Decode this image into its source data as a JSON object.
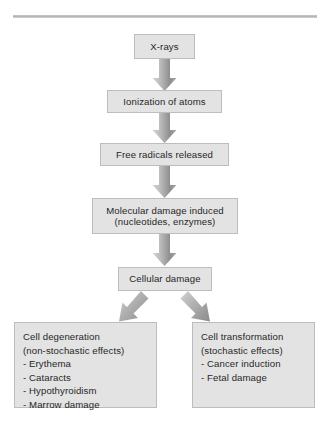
{
  "figure": {
    "background": "#ffffff",
    "rule_color": "#bdbdbd",
    "box_fill": "#e3e3e3",
    "box_border": "#bdbdbd",
    "arrow_color": "#9a9a9a",
    "text_color": "#272727"
  },
  "nodes": {
    "xrays": {
      "lines": [
        "X-rays"
      ]
    },
    "ionization": {
      "lines": [
        "Ionization of atoms"
      ]
    },
    "free_radicals": {
      "lines": [
        "Free radicals released"
      ]
    },
    "molecular_damage": {
      "lines": [
        "Molecular damage induced",
        "(nucleotides, enzymes)"
      ]
    },
    "cellular_damage": {
      "lines": [
        "Cellular damage"
      ]
    },
    "cell_degeneration": {
      "lines": [
        "Cell degeneration",
        "(non-stochastic effects)",
        "- Erythema",
        "- Cataracts",
        "- Hypothyroidism",
        "- Marrow damage"
      ]
    },
    "cell_transformation": {
      "lines": [
        "Cell transformation",
        "(stochastic effects)",
        "- Cancer induction",
        "- Fetal damage"
      ]
    }
  },
  "arrows": [
    {
      "name": "arrow-xrays-to-ionization",
      "direction": "down"
    },
    {
      "name": "arrow-ionization-to-free-radicals",
      "direction": "down"
    },
    {
      "name": "arrow-free-radicals-to-molecular-damage",
      "direction": "down"
    },
    {
      "name": "arrow-molecular-damage-to-cellular-damage",
      "direction": "down"
    },
    {
      "name": "arrow-cellular-damage-to-cell-degeneration",
      "direction": "down-left"
    },
    {
      "name": "arrow-cellular-damage-to-cell-transformation",
      "direction": "down-right"
    }
  ]
}
